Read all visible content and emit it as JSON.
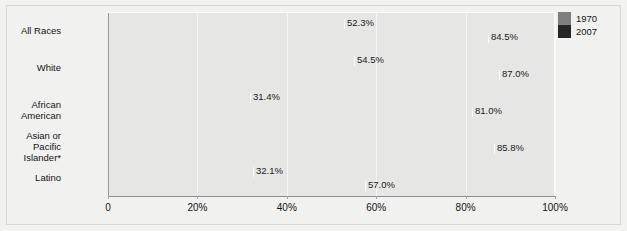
{
  "chart_data": {
    "type": "bar",
    "orientation": "horizontal",
    "title": "",
    "subtitle": "",
    "xlabel": "",
    "ylabel": "",
    "xlim": [
      0,
      100
    ],
    "xticks": [
      0,
      20,
      40,
      60,
      80,
      100
    ],
    "xticklabels": [
      "0",
      "20%",
      "40%",
      "60%",
      "80%",
      "100%"
    ],
    "grid": true,
    "grid_axis": "x",
    "legend_position": "top-right",
    "categories": [
      "All Races",
      "White",
      "African American",
      "Asian or Pacific\nIslander*",
      "Latino"
    ],
    "series": [
      {
        "name": "1970",
        "color": "#7f7f7f",
        "values": [
          52.3,
          54.5,
          31.4,
          null,
          32.1
        ],
        "labels": [
          "52.3%",
          "54.5%",
          "31.4%",
          "",
          "32.1%"
        ]
      },
      {
        "name": "2007",
        "color": "#262626",
        "values": [
          84.5,
          87.0,
          81.0,
          85.8,
          57.0
        ],
        "labels": [
          "84.5%",
          "87.0%",
          "81.0%",
          "85.8%",
          "57.0%"
        ]
      }
    ]
  },
  "legend": {
    "entries": [
      {
        "label": "1970",
        "color": "#7f7f7f"
      },
      {
        "label": "2007",
        "color": "#262626"
      }
    ]
  },
  "colors": {
    "page_background": "#f2f2f0",
    "plot_background": "#e6e6e4",
    "gridline": "#f6f6f5",
    "axis": "#8e8e8c",
    "text": "#141414",
    "series_1970": "#7f7f7f",
    "series_2007": "#262626"
  }
}
